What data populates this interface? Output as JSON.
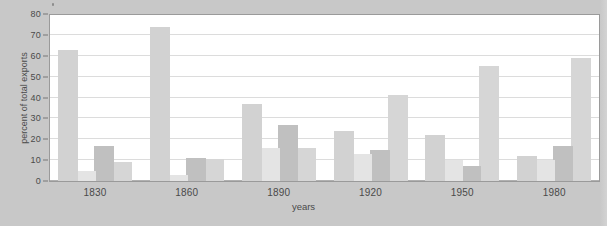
{
  "chart_data": {
    "type": "bar",
    "title": "",
    "xlabel": "years",
    "ylabel": "percent of total exports",
    "categories": [
      "1830",
      "1860",
      "1890",
      "1920",
      "1950",
      "1980"
    ],
    "ylim": [
      0,
      80
    ],
    "yticks": [
      0,
      10,
      20,
      30,
      40,
      50,
      60,
      70,
      80
    ],
    "grid": true,
    "legend": "none",
    "series": [
      {
        "name": "series-1",
        "color": "#d2d2d2",
        "values": [
          63,
          74,
          37,
          24,
          22,
          12
        ]
      },
      {
        "name": "series-2",
        "color": "#e4e4e4",
        "values": [
          5,
          3,
          16,
          13,
          10,
          10
        ]
      },
      {
        "name": "series-3",
        "color": "#c0c0c0",
        "values": [
          17,
          11,
          27,
          15,
          7,
          17
        ]
      },
      {
        "name": "series-4",
        "color": "#d6d6d6",
        "values": [
          9,
          10.5,
          16,
          41,
          55,
          59
        ]
      }
    ]
  },
  "axes": {
    "y_tick_labels": [
      "80",
      "70",
      "60",
      "50",
      "40",
      "30",
      "20",
      "10",
      "0"
    ],
    "y_axis_title": "percent of total exports",
    "x_tick_labels": [
      "1830",
      "1860",
      "1890",
      "1920",
      "1950",
      "1980"
    ],
    "x_axis_title": "years"
  },
  "style": {
    "page_background": "#c8c8c8",
    "plot_background": "#ffffff",
    "gridline_color": "#dcdcdc",
    "axis_text_color": "#4a4a4a",
    "panel_border": "#9a9a9a"
  }
}
